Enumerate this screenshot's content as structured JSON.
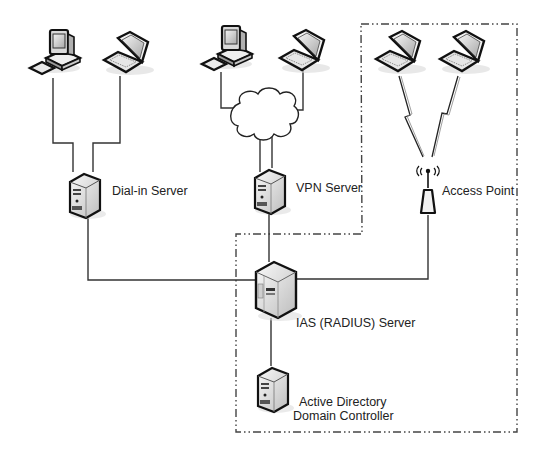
{
  "diagram": {
    "title": "",
    "colors": {
      "line": "#333333",
      "boundary": "#444444",
      "device_fill": "#e8e8e8",
      "device_outline": "#111111",
      "text": "#222222"
    },
    "nodes": {
      "desktop_1": {
        "label": "",
        "icon": "desktop-computer-icon"
      },
      "laptop_1": {
        "label": "",
        "icon": "laptop-icon"
      },
      "desktop_2": {
        "label": "",
        "icon": "desktop-computer-icon"
      },
      "laptop_2": {
        "label": "",
        "icon": "laptop-icon"
      },
      "laptop_3": {
        "label": "",
        "icon": "laptop-icon"
      },
      "laptop_4": {
        "label": "",
        "icon": "laptop-icon"
      },
      "internet_cloud": {
        "label": "",
        "icon": "cloud-icon"
      },
      "dialin_server": {
        "label": "Dial-in Server",
        "icon": "server-icon"
      },
      "vpn_server": {
        "label": "VPN Server",
        "icon": "server-icon"
      },
      "access_point": {
        "label": "Access Point",
        "icon": "wireless-access-point-icon"
      },
      "ias_server": {
        "label": "IAS (RADIUS) Server",
        "icon": "server-tower-icon"
      },
      "ad_controller": {
        "label_line1": "Active Directory",
        "label_line2": "Domain Controller",
        "icon": "server-icon"
      }
    },
    "edges": [
      {
        "from": "desktop_1",
        "to": "dialin_server",
        "type": "wired"
      },
      {
        "from": "laptop_1",
        "to": "dialin_server",
        "type": "wired"
      },
      {
        "from": "desktop_2",
        "to": "internet_cloud",
        "type": "wired"
      },
      {
        "from": "laptop_2",
        "to": "internet_cloud",
        "type": "wired"
      },
      {
        "from": "internet_cloud",
        "to": "vpn_server",
        "type": "wired"
      },
      {
        "from": "laptop_3",
        "to": "access_point",
        "type": "wireless"
      },
      {
        "from": "laptop_4",
        "to": "access_point",
        "type": "wireless"
      },
      {
        "from": "dialin_server",
        "to": "ias_server",
        "type": "wired"
      },
      {
        "from": "vpn_server",
        "to": "ias_server",
        "type": "wired"
      },
      {
        "from": "access_point",
        "to": "ias_server",
        "type": "wired"
      },
      {
        "from": "ias_server",
        "to": "ad_controller",
        "type": "wired"
      }
    ],
    "boundary": {
      "style": "dash-dot",
      "encloses": [
        "laptop_3",
        "laptop_4",
        "access_point",
        "ias_server",
        "ad_controller"
      ]
    }
  }
}
